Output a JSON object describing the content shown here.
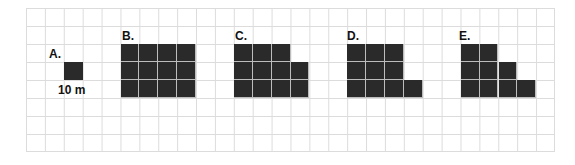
{
  "grid": {
    "columns": 28,
    "rows": 8,
    "cell_px_w": 18.9,
    "cell_px_h": 18,
    "line_color": "#dcdcdc"
  },
  "fill_color": "#2a2a2a",
  "shapes": [
    {
      "label": "A.",
      "cells": [
        [
          2,
          3
        ]
      ],
      "note": "10 m"
    },
    {
      "label": "B.",
      "cells": [
        [
          5,
          2
        ],
        [
          6,
          2
        ],
        [
          7,
          2
        ],
        [
          8,
          2
        ],
        [
          5,
          3
        ],
        [
          6,
          3
        ],
        [
          7,
          3
        ],
        [
          8,
          3
        ],
        [
          5,
          4
        ],
        [
          6,
          4
        ],
        [
          7,
          4
        ],
        [
          8,
          4
        ]
      ]
    },
    {
      "label": "C.",
      "cells": [
        [
          11,
          2
        ],
        [
          12,
          2
        ],
        [
          13,
          2
        ],
        [
          11,
          3
        ],
        [
          12,
          3
        ],
        [
          13,
          3
        ],
        [
          14,
          3
        ],
        [
          11,
          4
        ],
        [
          12,
          4
        ],
        [
          13,
          4
        ],
        [
          14,
          4
        ]
      ]
    },
    {
      "label": "D.",
      "cells": [
        [
          17,
          2
        ],
        [
          18,
          2
        ],
        [
          19,
          2
        ],
        [
          17,
          3
        ],
        [
          18,
          3
        ],
        [
          19,
          3
        ],
        [
          17,
          4
        ],
        [
          18,
          4
        ],
        [
          19,
          4
        ],
        [
          20,
          4
        ]
      ]
    },
    {
      "label": "E.",
      "cells": [
        [
          23,
          2
        ],
        [
          24,
          2
        ],
        [
          23,
          3
        ],
        [
          24,
          3
        ],
        [
          25,
          3
        ],
        [
          23,
          4
        ],
        [
          24,
          4
        ],
        [
          25,
          4
        ],
        [
          26,
          4
        ]
      ]
    }
  ]
}
